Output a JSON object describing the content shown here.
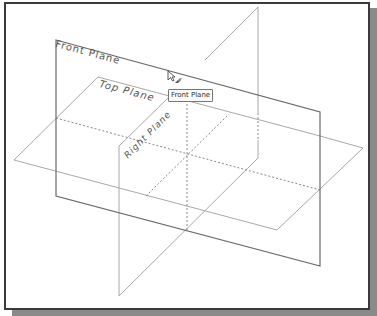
{
  "viewport": {
    "planes": {
      "front": {
        "label": "Front Plane"
      },
      "top": {
        "label": "Top Plane"
      },
      "right": {
        "label": "Right Plane"
      }
    },
    "tooltip": {
      "text": "Front Plane"
    },
    "colors": {
      "frame_border": "#3a3a3a",
      "shadow": "#8a8a8a",
      "plane_edge_dark": "#6a6a6a",
      "plane_edge_light": "#a8a8a8",
      "hidden_line": "#888888"
    }
  }
}
